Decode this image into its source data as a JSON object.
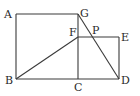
{
  "diagram": {
    "type": "geometry",
    "points": {
      "A": {
        "label": "A",
        "x": 16,
        "y": 14
      },
      "G": {
        "label": "G",
        "x": 78,
        "y": 14
      },
      "B": {
        "label": "B",
        "x": 16,
        "y": 79
      },
      "C": {
        "label": "C",
        "x": 78,
        "y": 79
      },
      "D": {
        "label": "D",
        "x": 119,
        "y": 79
      },
      "E": {
        "label": "E",
        "x": 119,
        "y": 37
      },
      "F": {
        "label": "F",
        "x": 78,
        "y": 37
      },
      "P": {
        "label": "P",
        "x": 89,
        "y": 37
      }
    },
    "segments": [
      [
        "A",
        "G"
      ],
      [
        "A",
        "B"
      ],
      [
        "B",
        "C"
      ],
      [
        "C",
        "D"
      ],
      [
        "G",
        "C"
      ],
      [
        "F",
        "E"
      ],
      [
        "E",
        "D"
      ],
      [
        "B",
        "F"
      ],
      [
        "G",
        "D"
      ]
    ]
  }
}
